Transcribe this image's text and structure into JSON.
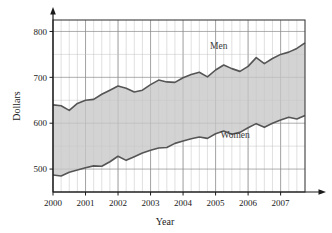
{
  "chart_data": {
    "type": "area",
    "title": "",
    "xlabel": "Year",
    "ylabel": "Dollars",
    "xlim": [
      2000,
      2007.75
    ],
    "ylim": [
      450,
      825
    ],
    "yticks": [
      500,
      600,
      700,
      800
    ],
    "xticks": [
      2000,
      2001,
      2002,
      2003,
      2004,
      2005,
      2006,
      2007
    ],
    "xtick_labels": [
      "2000",
      "2001",
      "2002",
      "2003",
      "2004",
      "2005",
      "2006",
      "2007"
    ],
    "ytick_labels": [
      "500",
      "600",
      "700",
      "800"
    ],
    "grid": true,
    "grid_minor_x": "quarterly",
    "grid_major_y_step": 50,
    "legend": "inline-annotations",
    "fill_between": true,
    "fill_color": "#c6c6c6",
    "line_color": "#555555",
    "annotations": [
      {
        "text": "Men",
        "x": 2005.1,
        "y": 762
      },
      {
        "text": "Women",
        "x": 2005.6,
        "y": 568
      }
    ],
    "x": [
      2000.0,
      2000.25,
      2000.5,
      2000.75,
      2001.0,
      2001.25,
      2001.5,
      2001.75,
      2002.0,
      2002.25,
      2002.5,
      2002.75,
      2003.0,
      2003.25,
      2003.5,
      2003.75,
      2004.0,
      2004.25,
      2004.5,
      2004.75,
      2005.0,
      2005.25,
      2005.5,
      2005.75,
      2006.0,
      2006.25,
      2006.5,
      2006.75,
      2007.0,
      2007.25,
      2007.5,
      2007.75
    ],
    "series": [
      {
        "name": "Men",
        "color": "#555555",
        "values": [
          640,
          638,
          628,
          643,
          650,
          652,
          663,
          672,
          681,
          676,
          668,
          672,
          684,
          694,
          690,
          689,
          699,
          706,
          711,
          701,
          716,
          727,
          719,
          713,
          724,
          743,
          730,
          741,
          750,
          755,
          763,
          775
        ]
      },
      {
        "name": "Women",
        "color": "#555555",
        "values": [
          487,
          485,
          493,
          498,
          503,
          507,
          506,
          516,
          528,
          519,
          527,
          535,
          541,
          546,
          547,
          556,
          561,
          566,
          570,
          567,
          577,
          583,
          576,
          580,
          590,
          599,
          591,
          600,
          607,
          613,
          609,
          617
        ]
      }
    ]
  },
  "axis": {
    "y_title": "Dollars",
    "x_title": "Year"
  }
}
